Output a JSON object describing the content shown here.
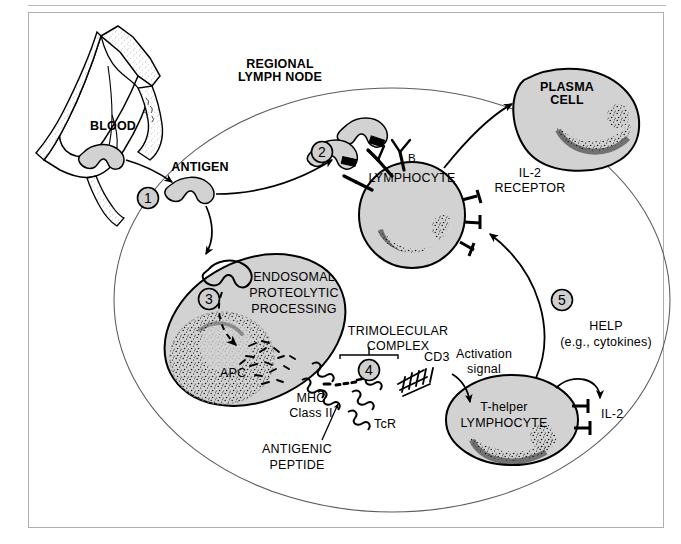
{
  "figure": {
    "title_visible": false,
    "domain": "immunology-schematic",
    "compartment_label": "REGIONAL\nLYMPH NODE",
    "compartment_label_line1": "REGIONAL",
    "compartment_label_line2": "LYMPH NODE"
  },
  "colors": {
    "cell_fill": "#d2d2d2",
    "outline": "#000000",
    "frame_border": "#b0b0b0",
    "rule": "#b9b9b9",
    "background": "#ffffff",
    "stipple": "#111111",
    "thin_line": "#555555"
  },
  "steps": [
    {
      "number": "1",
      "id": "step-1",
      "meaning": "antigen enters tissue from blood"
    },
    {
      "number": "2",
      "id": "step-2",
      "meaning": "antigen binds B lymphocyte surface antibody"
    },
    {
      "number": "3",
      "id": "step-3",
      "meaning": "endosomal proteolytic processing in APC"
    },
    {
      "number": "4",
      "id": "step-4",
      "meaning": "trimolecular complex formation"
    },
    {
      "number": "5",
      "id": "step-5",
      "meaning": "T-helper provides help to B lymphocyte"
    }
  ],
  "labels": {
    "blood": "BLOOD",
    "antigen": "ANTIGEN",
    "plasma_cell_l1": "PLASMA",
    "plasma_cell_l2": "CELL",
    "b_lymphocyte_l1": "B",
    "b_lymphocyte_l2": "LYMPHOCYTE",
    "il2_receptor_l1": "IL-2",
    "il2_receptor_l2": "RECEPTOR",
    "endosomal_l1": "ENDOSOMAL",
    "endosomal_l2": "PROTEOLYTIC",
    "endosomal_l3": "PROCESSING",
    "apc": "APC",
    "trimolecular_l1": "TRIMOLECULAR",
    "trimolecular_l2": "COMPLEX",
    "mhc_l1": "MHC",
    "mhc_l2": "Class II",
    "antigenic_peptide_l1": "ANTIGENIC",
    "antigenic_peptide_l2": "PEPTIDE",
    "tcr": "TcR",
    "cd3": "CD3",
    "activation_l1": "Activation",
    "activation_l2": "signal",
    "t_helper_l1": "T-helper",
    "t_helper_l2": "LYMPHOCYTE",
    "il2": "IL-2",
    "help_l1": "HELP",
    "help_l2": "(e.g., cytokines)"
  },
  "structures": [
    {
      "name": "blood-vessel",
      "kind": "torn-vessel-segment",
      "fill": "#ffffff",
      "wall": "stippled"
    },
    {
      "name": "lymph-node-outline",
      "kind": "large-ellipse",
      "fill": "none"
    },
    {
      "name": "antigen-particle",
      "kind": "notched-blob",
      "fill": "#d2d2d2",
      "count": 4
    },
    {
      "name": "apc-cell",
      "kind": "ellipse",
      "fill": "#d2d2d2"
    },
    {
      "name": "b-lymphocyte",
      "kind": "circle",
      "fill": "#d2d2d2"
    },
    {
      "name": "plasma-cell",
      "kind": "irregular-blob",
      "fill": "#d2d2d2"
    },
    {
      "name": "t-helper-lymphocyte",
      "kind": "ellipse",
      "fill": "#d2d2d2"
    }
  ]
}
